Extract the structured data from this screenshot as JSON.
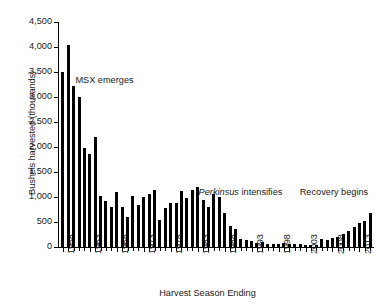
{
  "chart_data": {
    "type": "bar",
    "title": "",
    "xlabel": "Harvest Season Ending",
    "ylabel": "Bushels harvested (thousands)",
    "ylim": [
      0,
      4500
    ],
    "ytick_labels": [
      "0",
      "500",
      "1,000",
      "1,500",
      "2,000",
      "2,500",
      "3,000",
      "3,500",
      "4,000",
      "4,500"
    ],
    "ytick_values": [
      0,
      500,
      1000,
      1500,
      2000,
      2500,
      3000,
      3500,
      4000,
      4500
    ],
    "xtick_labels": [
      "1958",
      "1963",
      "1968",
      "1973",
      "1978",
      "1983",
      "1988",
      "1993",
      "1998",
      "2003",
      "2008",
      "2013"
    ],
    "grid": false,
    "legend": "none",
    "bar_color": "#000000",
    "categories": [
      "1958",
      "1959",
      "1960",
      "1961",
      "1962",
      "1963",
      "1964",
      "1965",
      "1966",
      "1967",
      "1968",
      "1969",
      "1970",
      "1971",
      "1972",
      "1973",
      "1974",
      "1975",
      "1976",
      "1977",
      "1978",
      "1979",
      "1980",
      "1981",
      "1982",
      "1983",
      "1984",
      "1985",
      "1986",
      "1987",
      "1988",
      "1989",
      "1990",
      "1991",
      "1992",
      "1993",
      "1994",
      "1995",
      "1996",
      "1997",
      "1998",
      "1999",
      "2000",
      "2001",
      "2002",
      "2003",
      "2004",
      "2005",
      "2006",
      "2007",
      "2008",
      "2009",
      "2010",
      "2011",
      "2012",
      "2013",
      "2014",
      "2015"
    ],
    "values": [
      3500,
      4050,
      3230,
      3010,
      1990,
      1870,
      2210,
      1030,
      930,
      800,
      1100,
      810,
      600,
      1020,
      850,
      1000,
      1060,
      1140,
      550,
      790,
      890,
      880,
      1120,
      980,
      1150,
      1200,
      940,
      800,
      1060,
      1010,
      690,
      430,
      370,
      170,
      140,
      130,
      90,
      100,
      70,
      70,
      60,
      90,
      60,
      70,
      60,
      50,
      50,
      50,
      170,
      140,
      190,
      200,
      270,
      330,
      400,
      490,
      530,
      680
    ],
    "annotations": [
      {
        "text": "MSX emerges",
        "x": 0.055,
        "y": 0.235
      },
      {
        "text": "Perkinsus intensifies",
        "italic_prefix": "Perkinsus",
        "rest": " intensifies",
        "x": 0.445,
        "y": 0.732
      },
      {
        "text": "Recovery begins",
        "x": 0.765,
        "y": 0.732
      }
    ]
  }
}
